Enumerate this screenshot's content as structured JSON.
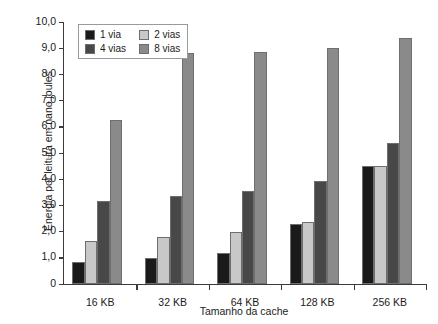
{
  "chart_data": {
    "type": "bar",
    "title": "",
    "xlabel": "Tamanho da cache",
    "ylabel": "Energia por leitura em nano joules",
    "categories": [
      "16 KB",
      "32 KB",
      "64 KB",
      "128 KB",
      "256 KB"
    ],
    "series": [
      {
        "name": "1 via",
        "color": "#1a1a1a",
        "values": [
          0.85,
          1.0,
          1.2,
          2.3,
          4.5
        ]
      },
      {
        "name": "2 vias",
        "color": "#c8c8c8",
        "values": [
          1.65,
          1.8,
          2.0,
          2.35,
          4.5
        ]
      },
      {
        "name": "4 vias",
        "color": "#484848",
        "values": [
          3.15,
          3.35,
          3.55,
          3.95,
          5.4
        ]
      },
      {
        "name": "8 vias",
        "color": "#8a8a8a",
        "values": [
          6.25,
          8.8,
          8.85,
          9.0,
          9.4
        ]
      }
    ],
    "ylim": [
      0,
      10
    ],
    "ytick_labels": [
      "0",
      "1,0",
      "2,0",
      "3,0",
      "4,0",
      "5,0",
      "6,0",
      "7,0",
      "8,0",
      "9,0",
      "10,0"
    ],
    "ytick_values": [
      0,
      1,
      2,
      3,
      4,
      5,
      6,
      7,
      8,
      9,
      10
    ],
    "grid": false,
    "legend_position": "upper-left",
    "legend_order": [
      "1 via",
      "2 vias",
      "4 vias",
      "8 vias"
    ]
  }
}
